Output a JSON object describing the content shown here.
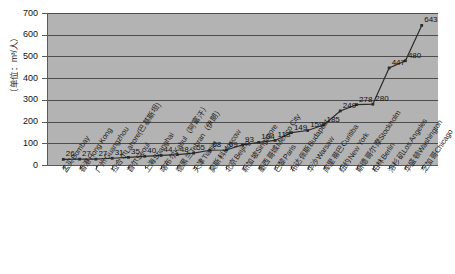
{
  "chart_data": {
    "type": "line",
    "title": "",
    "xlabel": "",
    "ylabel": "（单位：m³/人）",
    "ylim": [
      0,
      700
    ],
    "yticks": [
      0,
      100,
      200,
      300,
      400,
      500,
      600,
      700
    ],
    "grid": true,
    "legend": "none",
    "plot_background": "#b3b3b3",
    "series_color": "#2b2b2b",
    "categories": [
      "孟买Bombay",
      "香港Hong Kong",
      "广州Guangzhou",
      "拉合尔Lahore(巴基斯坦)",
      "首尔Seoul",
      "上海Shanghai",
      "喀布尔Kabul（阿富汗）",
      "德黑兰Tehran（伊朗）",
      "天津Tianjin",
      "莫斯科Moscow",
      "北京Beijing",
      "新加坡Singapore",
      "墨西哥城Mexico City",
      "巴黎Paris",
      "布达佩斯Budapest",
      "华沙Warsaw",
      "库里蒂巴Curitiba",
      "纽约New York",
      "斯德哥尔摩Stockholm",
      "柏林Berlin",
      "洛杉矶Los Angeles",
      "华盛顿Washington",
      "芝加哥Chicago"
    ],
    "values": [
      26,
      27,
      27,
      31,
      35,
      40,
      44,
      48,
      55,
      68,
      69,
      93,
      104,
      113,
      149,
      159,
      185,
      249,
      278,
      280,
      447,
      480,
      643
    ],
    "data_labels": [
      "26",
      "27",
      "27",
      "31",
      "35",
      "40",
      "44",
      "48",
      "55",
      "68",
      "69",
      "93",
      "104",
      "113",
      "149",
      "159",
      "185",
      "249",
      "278",
      "280",
      "447",
      "480",
      "643"
    ]
  }
}
